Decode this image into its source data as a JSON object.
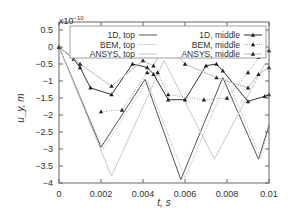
{
  "chart_data": {
    "type": "line",
    "title": "",
    "xlabel": "t, s",
    "ylabel": "u_y, m",
    "y_multiplier": "x10^-10",
    "xlim": [
      0,
      0.01
    ],
    "ylim": [
      -4,
      0.5
    ],
    "xticks": [
      0,
      0.002,
      0.004,
      0.006,
      0.008,
      0.01
    ],
    "xtick_labels": [
      "0",
      "0.002",
      "0.004",
      "0.006",
      "0.008",
      "0.01"
    ],
    "yticks": [
      0.5,
      0,
      -0.5,
      -1,
      -1.5,
      -2,
      -2.5,
      -3,
      -3.5,
      -4
    ],
    "ytick_labels": [
      "0.5",
      "0",
      "−0.5",
      "−1",
      "−1.5",
      "−2",
      "−2.5",
      "−3",
      "−3.5",
      "−4"
    ],
    "grid": false,
    "legend_position": "top",
    "series": [
      {
        "name": "1D, top",
        "color": "#555555",
        "style": "solid",
        "marker": "none",
        "x": [
          0,
          0.002,
          0.0041,
          0.0058,
          0.0078,
          0.0095,
          0.01
        ],
        "y": [
          0,
          -2.95,
          -0.95,
          -3.9,
          -0.9,
          -3.3,
          -2.3
        ]
      },
      {
        "name": "BEM, top",
        "color": "#aaaaaa",
        "style": "dotted",
        "marker": "none",
        "x": [
          0,
          0.0021,
          0.0042,
          0.006,
          0.008,
          0.0096,
          0.01
        ],
        "y": [
          0,
          -3.0,
          -1.0,
          -3.85,
          -0.95,
          -3.25,
          -2.4
        ]
      },
      {
        "name": "ANSYS, top",
        "color": "#c8c8c8",
        "style": "solid",
        "marker": "none",
        "x": [
          0,
          0.0025,
          0.005,
          0.0074,
          0.0098,
          0.01
        ],
        "y": [
          0,
          -3.8,
          -0.4,
          -3.3,
          -0.5,
          -0.5
        ]
      },
      {
        "name": "1D, middle",
        "color": "#333333",
        "style": "solid",
        "marker": "triangle",
        "x": [
          0,
          0.0007,
          0.001,
          0.0015,
          0.0025,
          0.0035,
          0.0042,
          0.0045,
          0.0052,
          0.006,
          0.007,
          0.0075,
          0.0078,
          0.009,
          0.0098,
          0.01
        ],
        "y": [
          0,
          -0.35,
          -0.6,
          -1.2,
          -1.4,
          -0.5,
          -0.6,
          -0.8,
          -1.55,
          -1.55,
          -0.55,
          -0.5,
          -0.7,
          -1.6,
          -1.45,
          -1.4
        ]
      },
      {
        "name": "BEM, middle",
        "color": "#999999",
        "style": "dotted",
        "marker": "triangle",
        "x": [
          0.002,
          0.003,
          0.0042,
          0.0047,
          0.0052,
          0.0069,
          0.008,
          0.009,
          0.0095,
          0.01
        ],
        "y": [
          -1.9,
          -1.85,
          -0.75,
          -0.75,
          -1.4,
          -1.55,
          -1.5,
          -0.75,
          -0.3,
          -0.1
        ]
      },
      {
        "name": "ANSYS, middle",
        "color": "#bbbbbb",
        "style": "solid",
        "marker": "triangle",
        "x": [
          0,
          0.001,
          0.0025,
          0.004,
          0.0045,
          0.0048,
          0.0055,
          0.006,
          0.0075,
          0.009,
          0.0095,
          0.01
        ],
        "y": [
          0,
          -0.5,
          -1.15,
          -0.4,
          -0.55,
          -0.2,
          -0.15,
          -0.5,
          -0.9,
          -1.2,
          -0.8,
          -0.6
        ]
      }
    ]
  }
}
